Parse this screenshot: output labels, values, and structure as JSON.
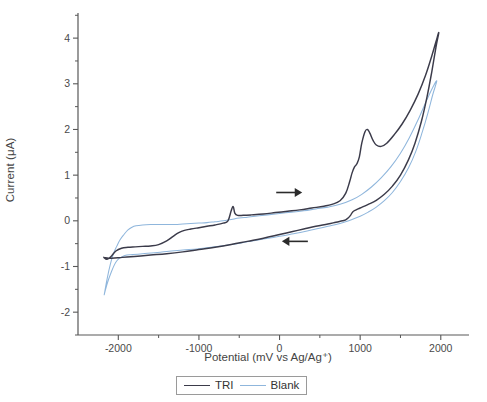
{
  "figure": {
    "type": "cyclic-voltammogram",
    "background": "#ffffff"
  },
  "axes": {
    "xlabel": "Potential (mV vs Ag/Ag⁺)",
    "ylabel": "Current (μA)",
    "x_ticks": [
      "-2000",
      "-1000",
      "0",
      "1000",
      "2000"
    ],
    "y_ticks": [
      "4",
      "3",
      "2",
      "1",
      "0",
      "-1",
      "-2"
    ],
    "xlim": [
      -2500,
      2350
    ],
    "ylim": [
      -2.5,
      4.55
    ],
    "minor_ticks": true,
    "grid": false,
    "spine_color": "#585858"
  },
  "legend": {
    "position": "below-axes",
    "items": [
      {
        "label": "TRI",
        "color": "#3b3b4a"
      },
      {
        "label": "Blank",
        "color": "#8fb6dc"
      }
    ]
  },
  "annotations": [
    {
      "name": "forward-scan-arrow",
      "direction": "right",
      "x": 120,
      "y": 0.62
    },
    {
      "name": "reverse-scan-arrow",
      "direction": "left",
      "x": 190,
      "y": -0.45
    }
  ],
  "chart_data": {
    "type": "line",
    "title": "",
    "xlabel": "Potential (mV vs Ag/Ag⁺)",
    "ylabel": "Current (μA)",
    "xlim": [
      -2500,
      2350
    ],
    "ylim": [
      -2.5,
      4.55
    ],
    "x_ticks": [
      -2000,
      -1000,
      0,
      1000,
      2000
    ],
    "y_ticks": [
      4,
      3,
      2,
      1,
      0,
      -1,
      -2
    ],
    "grid": false,
    "legend_position": "bottom",
    "series": [
      {
        "name": "TRI",
        "color": "#3b3b4a",
        "scan": "cyclic",
        "forward": [
          [
            -2180,
            -0.8
          ],
          [
            -2140,
            -0.84
          ],
          [
            -2090,
            -0.78
          ],
          [
            -2030,
            -0.66
          ],
          [
            -1960,
            -0.6
          ],
          [
            -1880,
            -0.58
          ],
          [
            -1790,
            -0.57
          ],
          [
            -1700,
            -0.56
          ],
          [
            -1600,
            -0.55
          ],
          [
            -1500,
            -0.52
          ],
          [
            -1400,
            -0.44
          ],
          [
            -1320,
            -0.34
          ],
          [
            -1250,
            -0.26
          ],
          [
            -1180,
            -0.21
          ],
          [
            -1100,
            -0.18
          ],
          [
            -1000,
            -0.15
          ],
          [
            -900,
            -0.12
          ],
          [
            -800,
            -0.09
          ],
          [
            -700,
            -0.05
          ],
          [
            -640,
            0.0
          ],
          [
            -600,
            0.22
          ],
          [
            -575,
            0.31
          ],
          [
            -555,
            0.17
          ],
          [
            -520,
            0.12
          ],
          [
            -450,
            0.12
          ],
          [
            -350,
            0.13
          ],
          [
            -200,
            0.15
          ],
          [
            -50,
            0.18
          ],
          [
            100,
            0.21
          ],
          [
            250,
            0.24
          ],
          [
            400,
            0.28
          ],
          [
            550,
            0.32
          ],
          [
            650,
            0.36
          ],
          [
            750,
            0.44
          ],
          [
            820,
            0.6
          ],
          [
            870,
            0.86
          ],
          [
            900,
            1.05
          ],
          [
            930,
            1.18
          ],
          [
            960,
            1.25
          ],
          [
            990,
            1.4
          ],
          [
            1020,
            1.7
          ],
          [
            1060,
            1.95
          ],
          [
            1090,
            2.0
          ],
          [
            1120,
            1.92
          ],
          [
            1160,
            1.76
          ],
          [
            1200,
            1.66
          ],
          [
            1260,
            1.63
          ],
          [
            1330,
            1.7
          ],
          [
            1420,
            1.88
          ],
          [
            1520,
            2.12
          ],
          [
            1620,
            2.42
          ],
          [
            1720,
            2.78
          ],
          [
            1810,
            3.18
          ],
          [
            1890,
            3.62
          ],
          [
            1940,
            3.92
          ],
          [
            1975,
            4.12
          ]
        ],
        "reverse": [
          [
            1975,
            4.12
          ],
          [
            1940,
            3.8
          ],
          [
            1890,
            3.28
          ],
          [
            1830,
            2.72
          ],
          [
            1760,
            2.18
          ],
          [
            1680,
            1.7
          ],
          [
            1600,
            1.34
          ],
          [
            1500,
            1.0
          ],
          [
            1400,
            0.76
          ],
          [
            1300,
            0.58
          ],
          [
            1200,
            0.45
          ],
          [
            1100,
            0.36
          ],
          [
            1000,
            0.28
          ],
          [
            950,
            0.24
          ],
          [
            910,
            0.2
          ],
          [
            880,
            0.12
          ],
          [
            850,
            0.06
          ],
          [
            820,
            0.02
          ],
          [
            780,
            0.0
          ],
          [
            700,
            -0.03
          ],
          [
            600,
            -0.07
          ],
          [
            450,
            -0.12
          ],
          [
            300,
            -0.18
          ],
          [
            150,
            -0.24
          ],
          [
            0,
            -0.3
          ],
          [
            -200,
            -0.38
          ],
          [
            -400,
            -0.45
          ],
          [
            -600,
            -0.52
          ],
          [
            -800,
            -0.58
          ],
          [
            -1000,
            -0.63
          ],
          [
            -1200,
            -0.68
          ],
          [
            -1400,
            -0.72
          ],
          [
            -1600,
            -0.75
          ],
          [
            -1800,
            -0.78
          ],
          [
            -1950,
            -0.8
          ],
          [
            -2080,
            -0.82
          ],
          [
            -2180,
            -0.8
          ]
        ]
      },
      {
        "name": "Blank",
        "color": "#8fb6dc",
        "scan": "cyclic",
        "forward": [
          [
            -2175,
            -1.62
          ],
          [
            -2140,
            -1.28
          ],
          [
            -2100,
            -0.96
          ],
          [
            -2060,
            -0.72
          ],
          [
            -2020,
            -0.56
          ],
          [
            -1980,
            -0.42
          ],
          [
            -1930,
            -0.3
          ],
          [
            -1880,
            -0.2
          ],
          [
            -1830,
            -0.14
          ],
          [
            -1780,
            -0.11
          ],
          [
            -1700,
            -0.09
          ],
          [
            -1600,
            -0.08
          ],
          [
            -1500,
            -0.08
          ],
          [
            -1400,
            -0.08
          ],
          [
            -1300,
            -0.08
          ],
          [
            -1200,
            -0.07
          ],
          [
            -1100,
            -0.06
          ],
          [
            -1000,
            -0.05
          ],
          [
            -900,
            -0.04
          ],
          [
            -800,
            -0.02
          ],
          [
            -700,
            0.0
          ],
          [
            -600,
            0.03
          ],
          [
            -500,
            0.06
          ],
          [
            -400,
            0.08
          ],
          [
            -300,
            0.1
          ],
          [
            -150,
            0.13
          ],
          [
            0,
            0.16
          ],
          [
            150,
            0.19
          ],
          [
            300,
            0.22
          ],
          [
            450,
            0.26
          ],
          [
            600,
            0.3
          ],
          [
            750,
            0.36
          ],
          [
            900,
            0.46
          ],
          [
            1020,
            0.58
          ],
          [
            1140,
            0.74
          ],
          [
            1260,
            0.94
          ],
          [
            1380,
            1.18
          ],
          [
            1500,
            1.48
          ],
          [
            1610,
            1.82
          ],
          [
            1720,
            2.22
          ],
          [
            1820,
            2.62
          ],
          [
            1900,
            2.92
          ],
          [
            1950,
            3.06
          ]
        ],
        "reverse": [
          [
            1950,
            3.06
          ],
          [
            1900,
            2.76
          ],
          [
            1840,
            2.36
          ],
          [
            1770,
            1.94
          ],
          [
            1690,
            1.52
          ],
          [
            1600,
            1.16
          ],
          [
            1500,
            0.86
          ],
          [
            1400,
            0.62
          ],
          [
            1300,
            0.44
          ],
          [
            1200,
            0.3
          ],
          [
            1100,
            0.19
          ],
          [
            1000,
            0.1
          ],
          [
            900,
            0.03
          ],
          [
            800,
            -0.03
          ],
          [
            700,
            -0.08
          ],
          [
            600,
            -0.12
          ],
          [
            450,
            -0.18
          ],
          [
            300,
            -0.24
          ],
          [
            150,
            -0.29
          ],
          [
            0,
            -0.34
          ],
          [
            -200,
            -0.4
          ],
          [
            -400,
            -0.46
          ],
          [
            -600,
            -0.52
          ],
          [
            -800,
            -0.57
          ],
          [
            -1000,
            -0.61
          ],
          [
            -1200,
            -0.64
          ],
          [
            -1400,
            -0.67
          ],
          [
            -1550,
            -0.7
          ],
          [
            -1700,
            -0.72
          ],
          [
            -1820,
            -0.74
          ],
          [
            -1920,
            -0.76
          ],
          [
            -2020,
            -0.88
          ],
          [
            -2100,
            -1.18
          ],
          [
            -2150,
            -1.45
          ],
          [
            -2175,
            -1.62
          ]
        ]
      }
    ]
  }
}
